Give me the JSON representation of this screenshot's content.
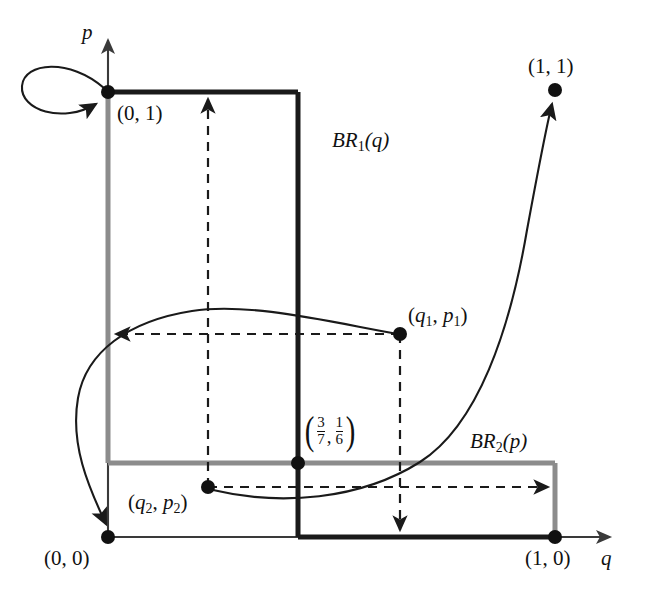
{
  "figure": {
    "kind": "best-response-correspondence-diagram",
    "axes": {
      "x_label": "q",
      "y_label": "p"
    },
    "curves": {
      "br1_label": "BR",
      "br1_sub": "1",
      "br1_arg": "(q)",
      "br1_full": "BR1(q)",
      "br2_label": "BR",
      "br2_sub": "2",
      "br2_arg": "(p)",
      "br2_full": "BR2(p)",
      "br1_color": "#1a1a1a",
      "br2_color": "#8c8c8c"
    },
    "points": [
      {
        "name": "origin",
        "label": "(0, 0)",
        "q": 0,
        "p": 0
      },
      {
        "name": "top-left",
        "label": "(0, 1)",
        "q": 0,
        "p": 1
      },
      {
        "name": "bottom-right",
        "label": "(1, 0)",
        "q": 1,
        "p": 0
      },
      {
        "name": "top-right",
        "label": "(1, 1)",
        "q": 1,
        "p": 1
      },
      {
        "name": "mixed-equilibrium",
        "label": "(3/7, 1/6)",
        "num1": "3",
        "den1": "7",
        "num2": "1",
        "den2": "6",
        "comma": ",",
        "q": 0.4286,
        "p": 0.1667
      },
      {
        "name": "start-1",
        "label": "(q1, p1)",
        "base": "q",
        "sub1": "1",
        "mid": ", ",
        "base2": "p",
        "sub2": "1"
      },
      {
        "name": "start-2",
        "label": "(q2, p2)",
        "base": "q",
        "sub1": "2",
        "mid": ", ",
        "base2": "p",
        "sub2": "2"
      }
    ],
    "point_labels": {
      "origin": "(0, 0)",
      "top_left": "(0, 1)",
      "bottom_right": "(1, 0)",
      "top_right": "(1, 1)",
      "q1p1_open": "(",
      "q1p1_q": "q",
      "q1p1_qsub": "1",
      "q1p1_comma": ", ",
      "q1p1_p": "p",
      "q1p1_psub": "1",
      "q1p1_close": ")",
      "q2p2_open": "(",
      "q2p2_q": "q",
      "q2p2_qsub": "2",
      "q2p2_comma": ", ",
      "q2p2_p": "p",
      "q2p2_psub": "2",
      "q2p2_close": ")"
    }
  }
}
